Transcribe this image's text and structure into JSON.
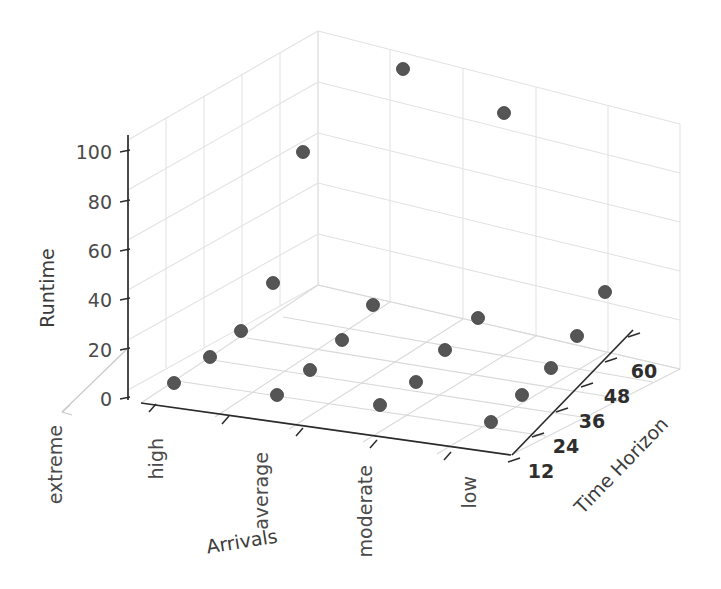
{
  "chart_data": {
    "type": "scatter",
    "projection": "3d",
    "title": "",
    "xlabel": "Arrivals",
    "ylabel": "Time Horizon",
    "zlabel": "Runtime",
    "x_categories": [
      "extreme",
      "high",
      "average",
      "moderate",
      "low"
    ],
    "y_ticks": [
      12,
      24,
      36,
      48,
      60
    ],
    "z_ticks": [
      0,
      20,
      40,
      60,
      80,
      100
    ],
    "zlim": [
      0,
      110
    ],
    "grid": true,
    "legend": "none",
    "marker": {
      "shape": "circle",
      "color": "#555555",
      "edge_color": "#3d3d3d",
      "size": 13
    },
    "points": [
      {
        "x": "extreme",
        "y": 12,
        "z": 2,
        "px": 174,
        "py": 383
      },
      {
        "x": "extreme",
        "y": 24,
        "z": 3,
        "px": 210,
        "py": 357
      },
      {
        "x": "extreme",
        "y": 36,
        "z": 4,
        "px": 241,
        "py": 331
      },
      {
        "x": "extreme",
        "y": 48,
        "z": 16,
        "px": 273,
        "py": 283
      },
      {
        "x": "extreme",
        "y": 60,
        "z": 101,
        "px": 303,
        "py": 152
      },
      {
        "x": "high",
        "y": 12,
        "z": 1,
        "px": 277,
        "py": 395
      },
      {
        "x": "high",
        "y": 24,
        "z": 3,
        "px": 310,
        "py": 370
      },
      {
        "x": "high",
        "y": 36,
        "z": 6,
        "px": 342,
        "py": 340
      },
      {
        "x": "high",
        "y": 48,
        "z": 11,
        "px": 373,
        "py": 305
      },
      {
        "x": "high",
        "y": 60,
        "z": 108,
        "px": 403,
        "py": 69
      },
      {
        "x": "average",
        "y": 12,
        "z": 1,
        "px": 380,
        "py": 405
      },
      {
        "x": "average",
        "y": 24,
        "z": 2,
        "px": 416,
        "py": 382
      },
      {
        "x": "average",
        "y": 36,
        "z": 5,
        "px": 445,
        "py": 350
      },
      {
        "x": "average",
        "y": 48,
        "z": 22,
        "px": 478,
        "py": 318
      },
      {
        "x": "average",
        "y": 60,
        "z": 104,
        "px": 504,
        "py": 113
      },
      {
        "x": "moderate",
        "y": 12,
        "z": 1,
        "px": 491,
        "py": 422
      },
      {
        "x": "moderate",
        "y": 24,
        "z": 2,
        "px": 522,
        "py": 395
      },
      {
        "x": "moderate",
        "y": 36,
        "z": 4,
        "px": 551,
        "py": 368
      },
      {
        "x": "moderate",
        "y": 48,
        "z": 7,
        "px": 577,
        "py": 336
      },
      {
        "x": "moderate",
        "y": 60,
        "z": 58,
        "px": 605,
        "py": 292
      }
    ],
    "annotations": []
  },
  "axes": {
    "z": {
      "title": "Runtime",
      "tick_labels": [
        "100",
        "80",
        "60",
        "40",
        "20",
        "0"
      ],
      "tick_y": [
        152,
        202,
        251,
        300,
        350,
        399
      ]
    },
    "x": {
      "title": "Arrivals",
      "tick_labels": [
        "extreme",
        "high",
        "average",
        "moderate",
        "low"
      ],
      "label_anchors": [
        {
          "x": 62,
          "y": 425
        },
        {
          "x": 160,
          "y": 440
        },
        {
          "x": 266,
          "y": 455
        },
        {
          "x": 372,
          "y": 468
        },
        {
          "x": 475,
          "y": 478
        }
      ]
    },
    "y": {
      "title": "Time Horizon",
      "tick_labels": [
        "12",
        "24",
        "36",
        "48",
        "60"
      ],
      "label_anchors": [
        {
          "x": 540,
          "y": 470
        },
        {
          "x": 565,
          "y": 446
        },
        {
          "x": 591,
          "y": 420
        },
        {
          "x": 616,
          "y": 395
        },
        {
          "x": 643,
          "y": 370
        }
      ]
    }
  }
}
